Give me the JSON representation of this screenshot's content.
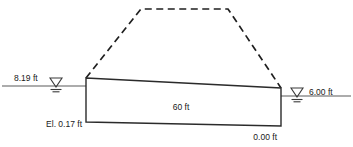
{
  "figure": {
    "background_color": "#ffffff",
    "line_color": "#2b2b2b",
    "dashed_color": "#1f1f1f",
    "water_line_color": "#5b5b5b",
    "text_color": "#1a1a1a"
  },
  "labels": {
    "headwater": "8.19 ft",
    "tailwater": "6.00 ft",
    "base_elevation_left": "El. 0.17 ft",
    "base_elevation_right": "0.00 ft",
    "base_width": "60 ft"
  },
  "icons": {
    "headwater_symbol": "water-surface-triangle-icon",
    "tailwater_symbol": "water-surface-triangle-icon"
  },
  "geometry": {
    "slab": {
      "top_left": [
        86,
        78
      ],
      "top_right": [
        281,
        88
      ],
      "bottom_right": [
        281,
        126
      ],
      "bottom_left": [
        86,
        122
      ]
    },
    "dashed_embankment": [
      [
        86,
        78
      ],
      [
        141,
        9
      ],
      [
        228,
        9
      ],
      [
        281,
        88
      ]
    ],
    "headwater_line": {
      "y": 86,
      "x_start": 2,
      "x_end": 86
    },
    "tailwater_line": {
      "y": 96,
      "x_start": 281,
      "x_end": 351
    },
    "headwater_marker_x": 56,
    "tailwater_marker_x": 297
  }
}
